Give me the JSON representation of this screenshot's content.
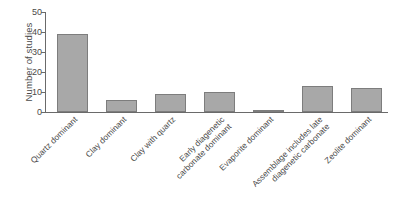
{
  "chart_data": {
    "type": "bar",
    "title": "",
    "xlabel": "",
    "ylabel": "Number of studies",
    "categories": [
      "Quartz dominant",
      "Clay dominant",
      "Clay with quartz",
      "Early diagenetic carbonate dominant",
      "Evaporite dominant",
      "Assemblage includes late diagenetic carbonate",
      "Zeolite dominant"
    ],
    "category_lines": [
      [
        "Quartz dominant"
      ],
      [
        "Clay dominant"
      ],
      [
        "Clay with quartz"
      ],
      [
        "Early diagenetic",
        "carbonate dominant"
      ],
      [
        "Evaporite dominant"
      ],
      [
        "Assemblage includes late",
        "diagenetic carbonate"
      ],
      [
        "Zeolite dominant"
      ]
    ],
    "values": [
      39,
      6,
      9,
      10,
      1,
      13,
      12
    ],
    "ylim": [
      0,
      50
    ],
    "yticks": [
      0,
      10,
      20,
      30,
      40,
      50
    ],
    "ytick_labels": [
      "0",
      "10",
      "20",
      "30",
      "40",
      "50"
    ],
    "grid": false,
    "legend": false,
    "orientation": "vertical",
    "bar_color": "#a8a8a8",
    "bar_edge_color": "#7d7d7d",
    "axis_color": "#6a6a6a",
    "text_color": "#4a4a4a",
    "background": "#ffffff",
    "label_rotation_deg": 45
  }
}
